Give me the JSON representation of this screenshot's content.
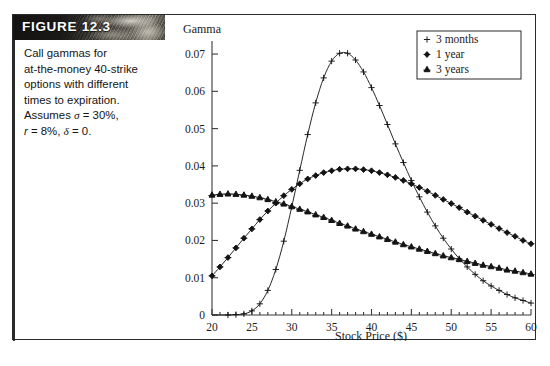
{
  "figure": {
    "label": "FIGURE 12.3",
    "caption_lines": [
      "Call gammas for",
      "at-the-money 40-strike",
      "options with different",
      "times to expiration."
    ],
    "assumption_line_1_prefix": "Assumes ",
    "assumption_line_1_sigma": "σ",
    "assumption_line_1_value": " = 30%,",
    "assumption_line_2_r": "r",
    "assumption_line_2_mid": " = 8%,  ",
    "assumption_line_2_delta": "δ",
    "assumption_line_2_end": " = 0."
  },
  "chart_data": {
    "type": "line",
    "title": "",
    "ylabel": "Gamma",
    "xlabel": "Stock Price ($)",
    "xlim": [
      20,
      60
    ],
    "ylim": [
      0,
      0.0735
    ],
    "xticks": [
      20,
      25,
      30,
      35,
      40,
      45,
      50,
      55,
      60
    ],
    "xticklabels": [
      "20",
      "25",
      "30",
      "35",
      "40",
      "45",
      "50",
      "55",
      "60"
    ],
    "yticks": [
      0,
      0.01,
      0.02,
      0.03,
      0.04,
      0.05,
      0.06,
      0.07
    ],
    "yticklabels": [
      "0",
      "0.01",
      "0.02",
      "0.03",
      "0.04",
      "0.05",
      "0.06",
      "0.07"
    ],
    "grid": false,
    "legend_position": "upper right",
    "x": [
      20,
      21,
      22,
      23,
      24,
      25,
      26,
      27,
      28,
      29,
      30,
      31,
      32,
      33,
      34,
      35,
      36,
      37,
      38,
      39,
      40,
      41,
      42,
      43,
      44,
      45,
      46,
      47,
      48,
      49,
      50,
      51,
      52,
      53,
      54,
      55,
      56,
      57,
      58,
      59,
      60
    ],
    "series": [
      {
        "name": "3 months",
        "marker": "plus",
        "values": [
          0.0,
          0.0,
          0.0,
          0.0001,
          0.0003,
          0.0011,
          0.003,
          0.0066,
          0.0122,
          0.0198,
          0.029,
          0.0388,
          0.0484,
          0.0569,
          0.0636,
          0.0681,
          0.0702,
          0.0702,
          0.0684,
          0.0652,
          0.061,
          0.0562,
          0.0511,
          0.0459,
          0.0409,
          0.0361,
          0.0317,
          0.0276,
          0.0239,
          0.0206,
          0.0177,
          0.0151,
          0.0129,
          0.0109,
          0.0092,
          0.0078,
          0.0066,
          0.0055,
          0.0046,
          0.0039,
          0.0032
        ]
      },
      {
        "name": "1 year",
        "marker": "diamond",
        "values": [
          0.0105,
          0.0129,
          0.0154,
          0.018,
          0.0206,
          0.0231,
          0.0256,
          0.0279,
          0.03,
          0.032,
          0.0337,
          0.0352,
          0.0365,
          0.0374,
          0.0382,
          0.0387,
          0.0391,
          0.0392,
          0.0392,
          0.039,
          0.0387,
          0.0382,
          0.0376,
          0.0369,
          0.0361,
          0.0352,
          0.0342,
          0.0332,
          0.0321,
          0.031,
          0.0299,
          0.0288,
          0.0276,
          0.0265,
          0.0254,
          0.0243,
          0.0232,
          0.0221,
          0.0211,
          0.02,
          0.0191
        ]
      },
      {
        "name": "3 years",
        "marker": "triangle",
        "values": [
          0.0322,
          0.0324,
          0.0325,
          0.0324,
          0.0322,
          0.0319,
          0.0315,
          0.031,
          0.0304,
          0.0298,
          0.0291,
          0.0284,
          0.0277,
          0.0269,
          0.0262,
          0.0254,
          0.0246,
          0.0239,
          0.0231,
          0.0224,
          0.0217,
          0.021,
          0.0203,
          0.0196,
          0.0189,
          0.0183,
          0.0177,
          0.0171,
          0.0165,
          0.0159,
          0.0154,
          0.0149,
          0.0144,
          0.0139,
          0.0134,
          0.013,
          0.0126,
          0.0121,
          0.0118,
          0.0114,
          0.011
        ]
      }
    ]
  },
  "colors": {
    "ink": "#1a1a1a",
    "axis": "#3a3a3a",
    "frame": "#2b2b2b",
    "banner_bg": "#2e2c28",
    "banner_text": "#ffffff",
    "page": "#ffffff"
  }
}
